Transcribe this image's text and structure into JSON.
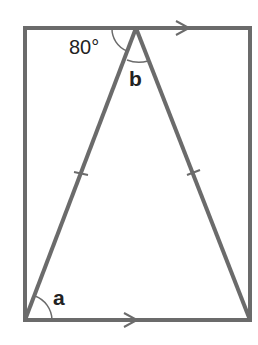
{
  "diagram": {
    "type": "geometry",
    "colors": {
      "stroke": "#6b6b6b",
      "text": "#222222",
      "background": "#ffffff"
    },
    "labels": {
      "angle_top_left": "80°",
      "angle_apex": "b",
      "angle_bottom_left": "a"
    },
    "markers": {
      "parallel_arrows": 2,
      "equal_side_ticks": 2
    }
  }
}
